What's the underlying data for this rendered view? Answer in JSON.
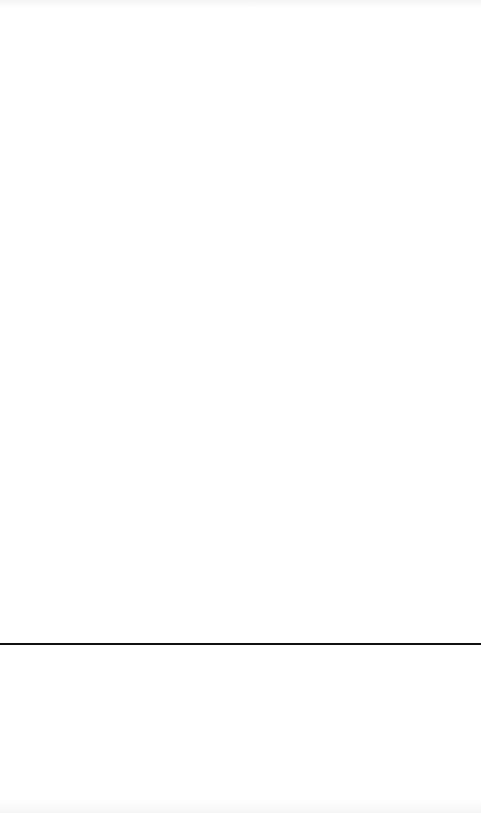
{
  "page": {
    "background_color": "#ffffff",
    "divider_color": "#111111"
  }
}
